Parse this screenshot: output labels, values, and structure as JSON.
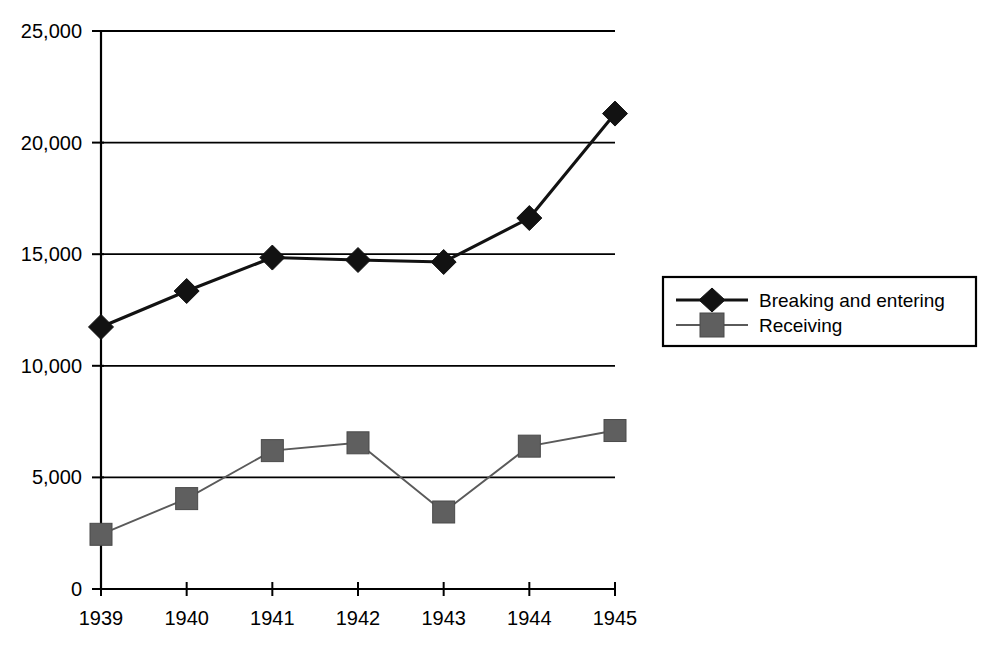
{
  "chart_data": {
    "type": "line",
    "title": "",
    "subtitle": "",
    "xlabel": "",
    "ylabel": "",
    "categories": [
      "1939",
      "1940",
      "1941",
      "1942",
      "1943",
      "1944",
      "1945"
    ],
    "x": [
      1939,
      1940,
      1941,
      1942,
      1943,
      1944,
      1945
    ],
    "ylim": [
      0,
      25000
    ],
    "xlim": [
      1939,
      1945
    ],
    "y_ticks": [
      0,
      5000,
      10000,
      15000,
      20000,
      25000
    ],
    "y_tick_labels": [
      "0",
      "5,000",
      "10,000",
      "15,000",
      "20,000",
      "25,000"
    ],
    "x_tick_labels": [
      "1939",
      "1940",
      "1941",
      "1942",
      "1943",
      "1944",
      "1945"
    ],
    "grid": "horizontal",
    "legend_position": "right",
    "series": [
      {
        "name": "Breaking and entering",
        "marker": "diamond",
        "color": "#121212",
        "line_width": "thick",
        "values": [
          11740,
          13350,
          14850,
          14740,
          14650,
          16620,
          21300
        ]
      },
      {
        "name": "Receiving",
        "marker": "square",
        "color": "#5f5f5f",
        "line_width": "thin",
        "values": [
          2450,
          4050,
          6200,
          6550,
          3450,
          6400,
          7100
        ]
      }
    ],
    "annotations": []
  },
  "legend": {
    "entries": [
      {
        "label": "Breaking and entering",
        "marker": "diamond-marker-icon"
      },
      {
        "label": "Receiving",
        "marker": "square-marker-icon"
      }
    ]
  },
  "axes": {
    "y_labels": [
      "25,000",
      "20,000",
      "15,000",
      "10,000",
      "5,000",
      "0"
    ],
    "x_labels": [
      "1939",
      "1940",
      "1941",
      "1942",
      "1943",
      "1944",
      "1945"
    ]
  },
  "colors": {
    "primary_series": "#121212",
    "secondary_series": "#5f5f5f",
    "axis": "#000000",
    "background": "#ffffff"
  }
}
